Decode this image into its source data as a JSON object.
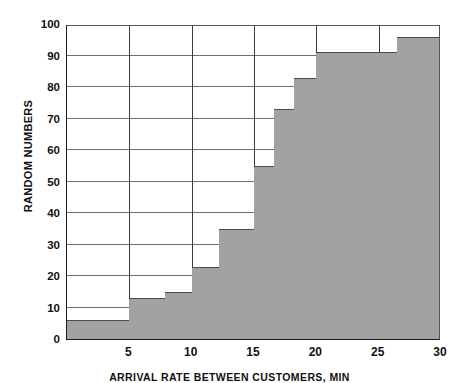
{
  "chart_data": {
    "type": "area",
    "title": "",
    "subtitle": "",
    "xlabel": "ARRIVAL RATE BETWEEN CUSTOMERS, MIN",
    "ylabel": "RANDOM NUMBERS",
    "xlim": [
      0,
      30
    ],
    "ylim": [
      0,
      100
    ],
    "grid": true,
    "legend": null,
    "x_ticks": [
      5,
      10,
      15,
      20,
      25,
      30
    ],
    "y_ticks": [
      0,
      10,
      20,
      30,
      40,
      50,
      60,
      70,
      80,
      90,
      100
    ],
    "x_gridlines": [
      5,
      10,
      15,
      20,
      25
    ],
    "y_gridlines": [
      10,
      20,
      30,
      40,
      50,
      60,
      70,
      80,
      90
    ],
    "series_name": "Cumulative distribution",
    "fill_color": "#a2a2a2",
    "edge_color": "#4a4a4a",
    "steps": [
      {
        "x_start": 0.0,
        "x_end": 5.0,
        "value": 6
      },
      {
        "x_start": 5.0,
        "x_end": 7.9,
        "value": 13
      },
      {
        "x_start": 7.9,
        "x_end": 10.0,
        "value": 15
      },
      {
        "x_start": 10.0,
        "x_end": 12.2,
        "value": 23
      },
      {
        "x_start": 12.2,
        "x_end": 15.0,
        "value": 35
      },
      {
        "x_start": 15.0,
        "x_end": 16.6,
        "value": 55
      },
      {
        "x_start": 16.6,
        "x_end": 18.2,
        "value": 73
      },
      {
        "x_start": 18.2,
        "x_end": 20.0,
        "value": 83
      },
      {
        "x_start": 20.0,
        "x_end": 26.5,
        "value": 91
      },
      {
        "x_start": 26.5,
        "x_end": 30.0,
        "value": 96
      }
    ]
  }
}
